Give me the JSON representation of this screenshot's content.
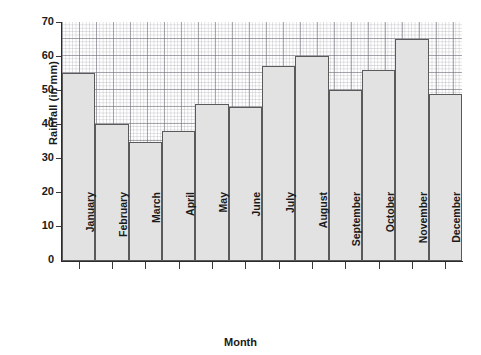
{
  "chart_data": {
    "type": "bar",
    "title": "",
    "xlabel": "Month",
    "ylabel": "Rainfall (in mm)",
    "categories": [
      "January",
      "February",
      "March",
      "April",
      "May",
      "June",
      "July",
      "August",
      "September",
      "October",
      "November",
      "December"
    ],
    "values": [
      55,
      40,
      35,
      38,
      46,
      45,
      57,
      60,
      50,
      56,
      65,
      49
    ],
    "ylim": [
      0,
      70
    ],
    "yticks": [
      0,
      10,
      20,
      30,
      40,
      50,
      60,
      70
    ],
    "ytick_labels": [
      "0",
      "10",
      "20",
      "30",
      "40",
      "50",
      "60",
      "70"
    ],
    "grid": true,
    "grid_style": "graph-paper minor and major gridlines",
    "legend": "none",
    "bar_fill_color": "#e2e2e2",
    "bar_edge_color": "#5a5a5a",
    "axis_color": "#2b2b2b",
    "background_color": "#ffffff"
  }
}
